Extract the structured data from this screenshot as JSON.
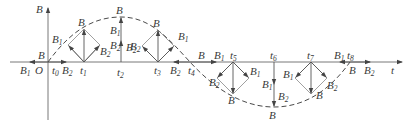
{
  "figure": {
    "type": "rotating-magnetic-field-decomposition",
    "axes": {
      "vertical_label": "B",
      "horizontal_label": "t",
      "origin_label": "O"
    },
    "time_marks": [
      "t0",
      "t1",
      "t2",
      "t3",
      "t4",
      "t5",
      "t6",
      "t7",
      "t8"
    ],
    "vector_labels": {
      "resultant": "B",
      "component_1": "B1",
      "component_2": "B2"
    },
    "envelope": "dashed cosine curve of resultant B vs t",
    "stations": [
      {
        "t": "t0",
        "note": "B1 points left, B2 points right; resultant B small at origin"
      },
      {
        "t": "t1",
        "note": "B1 up-left, B2 up-right; resultant B upward"
      },
      {
        "t": "t2",
        "note": "B1 and B2 both vertical up; B maximum"
      },
      {
        "t": "t3",
        "note": "B2 up-left, B1 up-right; resultant B upward"
      },
      {
        "t": "t4",
        "note": "B2 points left, B1 points right; B zero"
      },
      {
        "t": "t5",
        "note": "B2 down-left, B1 down-right; resultant B downward"
      },
      {
        "t": "t6",
        "note": "B1 and B2 both vertical down; B minimum"
      },
      {
        "t": "t7",
        "note": "B1 down-left, B2 down-right; resultant B downward"
      },
      {
        "t": "t8",
        "note": "B1 points left, B2 points right; B zero"
      }
    ]
  }
}
